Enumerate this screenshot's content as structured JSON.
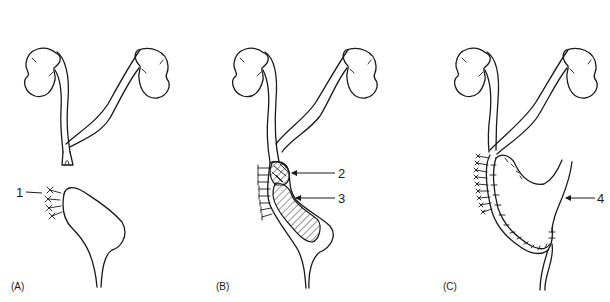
{
  "figure": {
    "panels": [
      {
        "id": "A",
        "label": "(A)",
        "callouts": [
          {
            "number": "1"
          }
        ]
      },
      {
        "id": "B",
        "label": "(B)",
        "callouts": [
          {
            "number": "2"
          },
          {
            "number": "3"
          }
        ]
      },
      {
        "id": "C",
        "label": "(C)",
        "callouts": [
          {
            "number": "4"
          }
        ]
      }
    ],
    "colors": {
      "line": "#1a1a1a",
      "background": "#ffffff"
    }
  }
}
